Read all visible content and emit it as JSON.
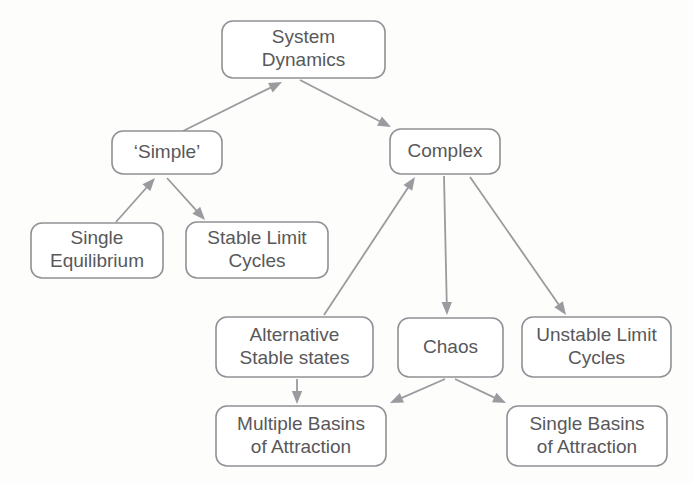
{
  "diagram": {
    "style": {
      "background": "#fdfdfc",
      "node_fill": "#ffffff",
      "node_border": "#8f9194",
      "text_color": "#58585a",
      "edge_color": "#9a9b9e"
    },
    "nodes": [
      {
        "id": "system-dynamics",
        "lines": [
          "System",
          "Dynamics"
        ],
        "x": 222,
        "y": 21,
        "w": 163,
        "h": 57,
        "r": 11
      },
      {
        "id": "simple",
        "lines": [
          "‘Simple’"
        ],
        "x": 112,
        "y": 131,
        "w": 110,
        "h": 43,
        "r": 11
      },
      {
        "id": "complex",
        "lines": [
          "Complex"
        ],
        "x": 390,
        "y": 129,
        "w": 110,
        "h": 45,
        "r": 11
      },
      {
        "id": "single-equilibrium",
        "lines": [
          "Single",
          "Equilibrium"
        ],
        "x": 31,
        "y": 223,
        "w": 132,
        "h": 55,
        "r": 11
      },
      {
        "id": "stable-limit-cycles",
        "lines": [
          "Stable Limit",
          "Cycles"
        ],
        "x": 186,
        "y": 222,
        "w": 142,
        "h": 56,
        "r": 11
      },
      {
        "id": "alternative-stable-states",
        "lines": [
          "Alternative",
          "Stable states"
        ],
        "x": 216,
        "y": 317,
        "w": 157,
        "h": 60,
        "r": 11
      },
      {
        "id": "chaos",
        "lines": [
          "Chaos"
        ],
        "x": 398,
        "y": 318,
        "w": 105,
        "h": 59,
        "r": 11
      },
      {
        "id": "unstable-limit-cycles",
        "lines": [
          "Unstable Limit",
          "Cycles"
        ],
        "x": 522,
        "y": 317,
        "w": 149,
        "h": 60,
        "r": 11
      },
      {
        "id": "multiple-basins-of-attraction",
        "lines": [
          "Multiple Basins",
          "of Attraction"
        ],
        "x": 216,
        "y": 406,
        "w": 170,
        "h": 60,
        "r": 11
      },
      {
        "id": "single-basins-of-attraction",
        "lines": [
          "Single Basins",
          "of Attraction"
        ],
        "x": 507,
        "y": 406,
        "w": 160,
        "h": 60,
        "r": 11
      }
    ],
    "edges": [
      {
        "id": "simple-to-system-dynamics",
        "from": "simple",
        "to": "system-dynamics",
        "x1": 183,
        "y1": 131,
        "x2": 282,
        "y2": 82
      },
      {
        "id": "system-dynamics-to-complex",
        "from": "system-dynamics",
        "to": "complex",
        "x1": 300,
        "y1": 80,
        "x2": 391,
        "y2": 127
      },
      {
        "id": "single-equilibrium-to-simple",
        "from": "single-equilibrium",
        "to": "simple",
        "x1": 116,
        "y1": 222,
        "x2": 155,
        "y2": 178
      },
      {
        "id": "simple-to-stable-limit-cycles",
        "from": "simple",
        "to": "stable-limit-cycles",
        "x1": 167,
        "y1": 178,
        "x2": 205,
        "y2": 220
      },
      {
        "id": "alternative-states-to-complex",
        "from": "alternative-stable-states",
        "to": "complex",
        "x1": 324,
        "y1": 315,
        "x2": 415,
        "y2": 177
      },
      {
        "id": "complex-to-chaos",
        "from": "complex",
        "to": "chaos",
        "x1": 444,
        "y1": 176,
        "x2": 447,
        "y2": 315
      },
      {
        "id": "complex-to-unstable-limit-cycles",
        "from": "complex",
        "to": "unstable-limit-cycles",
        "x1": 470,
        "y1": 177,
        "x2": 566,
        "y2": 315
      },
      {
        "id": "alternative-states-to-multiple",
        "from": "alternative-stable-states",
        "to": "multiple-basins-of-attraction",
        "x1": 297,
        "y1": 379,
        "x2": 297,
        "y2": 404
      },
      {
        "id": "chaos-to-multiple-basins",
        "from": "chaos",
        "to": "multiple-basins-of-attraction",
        "x1": 445,
        "y1": 379,
        "x2": 390,
        "y2": 403
      },
      {
        "id": "chaos-to-single-basins",
        "from": "chaos",
        "to": "single-basins-of-attraction",
        "x1": 455,
        "y1": 379,
        "x2": 506,
        "y2": 403
      }
    ]
  }
}
